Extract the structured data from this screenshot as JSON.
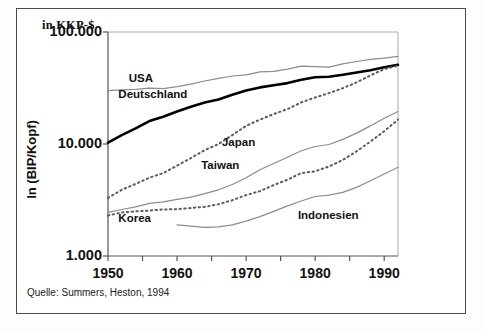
{
  "figure": {
    "unit_label": "in KKP-$",
    "y_axis_title": "ln (BIP/Kopf)",
    "source_note": "Quelle: Summers, Heston, 1994",
    "frame_color": "#4a4a4a",
    "background": "#ffffff"
  },
  "chart_data": {
    "type": "line",
    "title": "",
    "subtitle": "",
    "xlabel": "",
    "ylabel": "ln (BIP/Kopf)",
    "unit": "in KKP-$",
    "y_scale": "log",
    "grid": false,
    "legend": "inline-annotations",
    "xlim": [
      1950,
      1992
    ],
    "ylim": [
      1000,
      100000
    ],
    "x_ticks": [
      1950,
      1960,
      1970,
      1980,
      1990
    ],
    "x_minor_tick_step": 5,
    "y_ticks": [
      1000,
      10000,
      100000
    ],
    "y_tick_labels": [
      "1.000",
      "10.000",
      "100.000"
    ],
    "x": [
      1950,
      1952,
      1954,
      1956,
      1958,
      1960,
      1962,
      1964,
      1966,
      1968,
      1970,
      1972,
      1974,
      1976,
      1978,
      1980,
      1982,
      1984,
      1986,
      1988,
      1990,
      1992
    ],
    "series": [
      {
        "name": "USA",
        "style": "solid",
        "color": "#8c8c8c",
        "width": 1.2,
        "label_x": 1953.0,
        "label_y": 38000,
        "values": [
          30000,
          30500,
          30800,
          31500,
          31200,
          32500,
          34200,
          36500,
          38500,
          40500,
          41500,
          44000,
          44500,
          46500,
          49500,
          49000,
          48500,
          52000,
          54500,
          57000,
          58500,
          60500
        ]
      },
      {
        "name": "Deutschland",
        "style": "solid",
        "color": "#000000",
        "width": 2.6,
        "label_x": 1951.5,
        "label_y": 27500,
        "values": [
          10300,
          12000,
          13800,
          16000,
          17500,
          19500,
          21500,
          23500,
          25000,
          27500,
          30000,
          32000,
          33500,
          35000,
          37500,
          39500,
          39800,
          41500,
          43500,
          45500,
          48500,
          51000
        ]
      },
      {
        "name": "Japan",
        "style": "dotted",
        "color": "#5a5a5a",
        "width": 2.0,
        "label_x": 1966.5,
        "label_y": 10200,
        "values": [
          3300,
          3900,
          4400,
          5000,
          5500,
          6400,
          7500,
          8800,
          10000,
          12000,
          14500,
          16500,
          18500,
          20500,
          23500,
          26000,
          28500,
          31500,
          35500,
          41000,
          46500,
          50000
        ]
      },
      {
        "name": "Taiwan",
        "style": "solid",
        "color": "#8c8c8c",
        "width": 1.2,
        "label_x": 1963.5,
        "label_y": 6300,
        "values": [
          2450,
          2600,
          2750,
          2950,
          3050,
          3200,
          3350,
          3600,
          3900,
          4350,
          5000,
          5900,
          6700,
          7600,
          8700,
          9500,
          9900,
          11000,
          12500,
          14500,
          17000,
          19500
        ]
      },
      {
        "name": "Korea",
        "style": "dotted",
        "color": "#5a5a5a",
        "width": 2.0,
        "label_x": 1951.5,
        "label_y": 2150,
        "values": [
          2300,
          2450,
          2500,
          2550,
          2600,
          2620,
          2680,
          2750,
          2900,
          3150,
          3500,
          3800,
          4300,
          4800,
          5500,
          5700,
          6300,
          7200,
          8600,
          10500,
          13000,
          16500
        ]
      },
      {
        "name": "Indonesien",
        "style": "solid",
        "color": "#8c8c8c",
        "width": 1.2,
        "label_x": 1977.5,
        "label_y": 2280,
        "values": [
          null,
          null,
          null,
          null,
          null,
          1900,
          1850,
          1800,
          1820,
          1900,
          2050,
          2250,
          2500,
          2800,
          3100,
          3400,
          3500,
          3700,
          4100,
          4700,
          5400,
          6200
        ]
      }
    ]
  }
}
